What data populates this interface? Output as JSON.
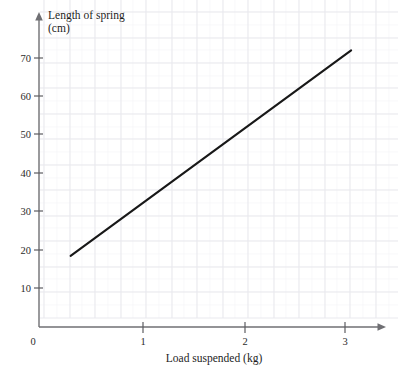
{
  "chart_data": {
    "type": "line",
    "title": "",
    "xlabel": "Load suspended (kg)",
    "ylabel": "Length of spring (cm)",
    "ylabel_line1": "Length of spring",
    "ylabel_line2": "(cm)",
    "xlim": [
      0,
      3.4
    ],
    "ylim": [
      0,
      78
    ],
    "xticks": [
      0,
      1,
      2,
      3
    ],
    "xtick_labels": [
      "0",
      "1",
      "2",
      "3"
    ],
    "yticks": [
      0,
      10,
      20,
      30,
      40,
      50,
      60,
      70
    ],
    "ytick_labels": [
      "0",
      "10",
      "20",
      "30",
      "40",
      "50",
      "60",
      "70"
    ],
    "grid": true,
    "grid_major_spacing_x": 0.25,
    "grid_major_spacing_y": 6.5,
    "legend": null,
    "series": [
      {
        "name": "Length of spring vs load",
        "x": [
          0.31,
          3.06
        ],
        "y": [
          18.5,
          72.0
        ],
        "color": "#181818",
        "style": "straight-line",
        "slope_cm_per_kg": 19.5,
        "intercept_cm": 12.5
      }
    ],
    "annotations": []
  },
  "axes": {
    "x_axis_name": "load-axis",
    "y_axis_name": "length-axis",
    "x_arrow": true,
    "y_arrow": true
  },
  "colors": {
    "background": "#ffffff",
    "grid_major": "#e9e9ee",
    "grid_minor": "#f4f4f7",
    "axis": "#6f6f73",
    "data_line": "#181818",
    "text": "#1d1d1d"
  }
}
